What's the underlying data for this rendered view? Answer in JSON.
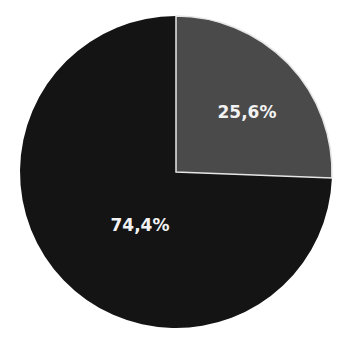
{
  "chart_data": {
    "type": "pie",
    "title": "",
    "categories": [
      "Segment A",
      "Segment B"
    ],
    "values": [
      25.6,
      74.4
    ],
    "labels": [
      "25,6%",
      "74,4%"
    ],
    "colors": [
      "#4a4a4a",
      "#141414"
    ],
    "start_angle": "12 o'clock, clockwise",
    "legend": "none"
  },
  "slices": [
    {
      "label": "25,6%",
      "color": "#4a4a4a"
    },
    {
      "label": "74,4%",
      "color": "#141414"
    }
  ]
}
